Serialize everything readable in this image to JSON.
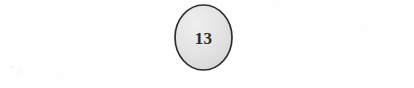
{
  "diagram": {
    "type": "node-with-edges",
    "background_color": "#fefefe",
    "node": {
      "label": "13",
      "shape": "ellipse",
      "center_x": 203.5,
      "center_y": 37.5,
      "radius_x": 28.5,
      "radius_y": 32.5,
      "fill_color": "#e3e3e3",
      "stroke_color": "#2e2e2e",
      "stroke_width": 1.6,
      "label_color": "#2b2b2b"
    },
    "edges": [
      {
        "name": "left-edge",
        "x1": 29,
        "y1": 36.5,
        "x2": 175,
        "y2": 36.5,
        "stroke_color": "#4a4a4a",
        "stroke_width": 1.5
      },
      {
        "name": "right-edge",
        "x1": 232,
        "y1": 36.5,
        "x2": 380,
        "y2": 36.5,
        "stroke_color": "#4a4a4a",
        "stroke_width": 1.5
      }
    ]
  }
}
